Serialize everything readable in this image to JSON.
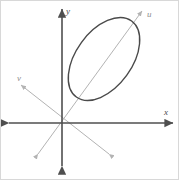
{
  "figure": {
    "kind": "coordinate-axes-with-ellipse",
    "background_color": "#ffffff",
    "border_color": "#d8d8d8",
    "width": 179,
    "height": 180,
    "origin": {
      "x": 61,
      "y": 122
    }
  },
  "labels": {
    "x_axis": "x",
    "y_axis": "y",
    "u_axis": "u",
    "v_axis": "v"
  },
  "colors": {
    "primary_axis": "#4f4f4f",
    "secondary_axis": "#b3b3b3",
    "ellipse_stroke": "#4a4a4a",
    "label_primary": "#4a4a4a",
    "label_secondary": "#8d8d8d"
  },
  "chart_data": {
    "type": "scatter",
    "title": "",
    "xlabel": "x",
    "ylabel": "y",
    "grid": false,
    "legend": null,
    "annotations": [
      {
        "text": "x",
        "x": 164,
        "y": 112,
        "style": "italic"
      },
      {
        "text": "y",
        "x": 66,
        "y": 11,
        "style": "italic"
      },
      {
        "text": "u",
        "x": 147,
        "y": 14,
        "style": "italic"
      },
      {
        "text": "v",
        "x": 17,
        "y": 78,
        "style": "italic"
      }
    ],
    "axes": [
      {
        "name": "x",
        "label": "x",
        "color": "#4f4f4f",
        "stroke_width": 1.6,
        "arrows": "both",
        "from": {
          "x": 8,
          "y": 122
        },
        "to": {
          "x": 172,
          "y": 122
        }
      },
      {
        "name": "y",
        "label": "y",
        "color": "#4f4f4f",
        "stroke_width": 1.6,
        "arrows": "both",
        "from": {
          "x": 61,
          "y": 165
        },
        "to": {
          "x": 61,
          "y": 8
        }
      },
      {
        "name": "u",
        "label": "u",
        "color": "#b3b3b3",
        "stroke_width": 1.0,
        "arrows": "both",
        "angle_deg": 54,
        "from": {
          "x": 37,
          "y": 153
        },
        "to": {
          "x": 141,
          "y": 10
        }
      },
      {
        "name": "v",
        "label": "v",
        "color": "#b3b3b3",
        "stroke_width": 1.0,
        "arrows": "both",
        "angle_deg": -38,
        "from": {
          "x": 20,
          "y": 84
        },
        "to": {
          "x": 108,
          "y": 153
        }
      }
    ],
    "shapes": [
      {
        "name": "ellipse",
        "type": "ellipse",
        "center": {
          "x": 103,
          "y": 58
        },
        "semi_major": 47,
        "semi_minor": 28,
        "rotation_deg": -54,
        "stroke": "#4a4a4a",
        "stroke_width": 1.4,
        "fill": "none",
        "bbox": {
          "x_min": 69,
          "x_max": 137,
          "y_min": 17,
          "y_max": 99
        }
      }
    ]
  }
}
